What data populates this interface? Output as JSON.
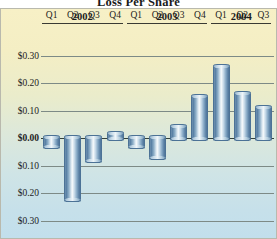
{
  "chart_data": {
    "type": "bar",
    "title": "Loss Per Share",
    "xlabel": "",
    "ylabel": "",
    "ylim": [
      -0.3,
      0.3
    ],
    "grid": true,
    "legend": "none",
    "year_groups": [
      {
        "year": "2002",
        "quarters": [
          "Q1",
          "Q2",
          "Q3",
          "Q4"
        ]
      },
      {
        "year": "2003",
        "quarters": [
          "Q1",
          "Q2",
          "Q3",
          "Q4"
        ]
      },
      {
        "year": "2004",
        "quarters": [
          "Q1",
          "Q2",
          "Q3"
        ]
      }
    ],
    "categories": [
      "2002 Q1",
      "2002 Q2",
      "2002 Q3",
      "2002 Q4",
      "2003 Q1",
      "2003 Q2",
      "2003 Q3",
      "2003 Q4",
      "2004 Q1",
      "2004 Q2",
      "2004 Q3"
    ],
    "values": [
      -0.03,
      -0.22,
      -0.08,
      0.01,
      -0.03,
      -0.07,
      0.04,
      0.15,
      0.26,
      0.16,
      0.11
    ],
    "ytick_labels": [
      "$0.30",
      "$0.20",
      "$0.10",
      "$0.00",
      "$0.10",
      "$0.20",
      "$0.30"
    ],
    "ytick_values": [
      0.3,
      0.2,
      0.1,
      0.0,
      -0.1,
      -0.2,
      -0.3
    ],
    "colors": {
      "bar_fill": "#7fa3c0",
      "bar_edge": "#4c7296",
      "gridline": "#7d8a86",
      "zero_line": "#33413e",
      "background_top": "#f7f0c6",
      "background_bottom": "#c2dfec",
      "frame_border": "#b9b9ad",
      "text": "#1c1c1c"
    }
  }
}
